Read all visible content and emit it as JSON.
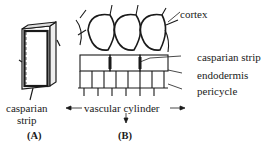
{
  "figure": {
    "panel_a": {
      "letter": "(A)",
      "labels": {
        "casparian_line1": "casparian",
        "casparian_line2": "strip"
      }
    },
    "panel_b": {
      "letter": "(B)",
      "labels": {
        "cortex": "cortex",
        "casparian_strip": "casparian strip",
        "endodermis": "endodermis",
        "pericycle": "pericycle"
      }
    },
    "shared": {
      "vascular_cylinder": "vascular cylinder"
    },
    "colors": {
      "ink": "#1a1a1a",
      "background": "#ffffff"
    }
  }
}
